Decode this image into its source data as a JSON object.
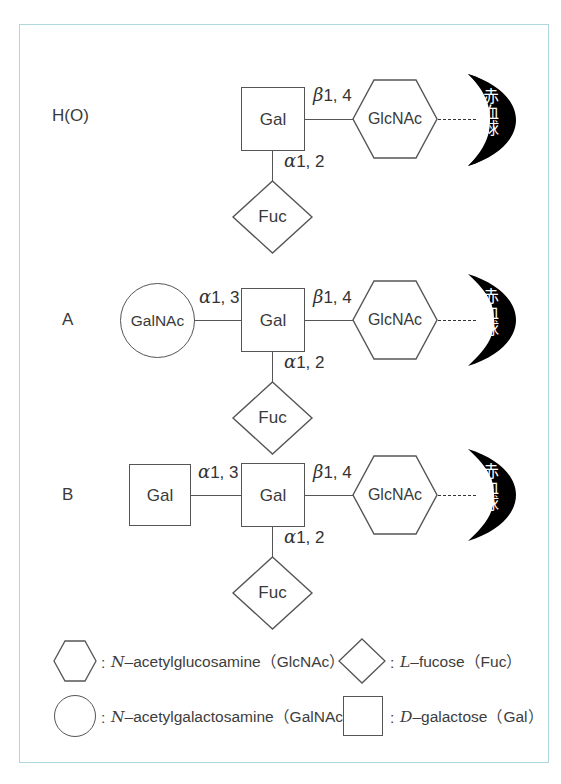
{
  "figure": {
    "title_visible": false,
    "border_color": "#aed8dd",
    "line_color": "#555555",
    "text_color": "#3a3a3a",
    "rbc_color": "#000000",
    "rbc_text_color": "#ffffff"
  },
  "rows": [
    {
      "id": "H(O)",
      "label": "H(O)",
      "nodes": [
        {
          "name": "Gal",
          "shape": "square"
        },
        {
          "name": "GlcNAc",
          "shape": "hexagon"
        },
        {
          "name": "Fuc",
          "shape": "diamond"
        }
      ],
      "bonds": [
        {
          "greek": "β",
          "numbers": "1, 4"
        },
        {
          "greek": "α",
          "numbers": "1, 2"
        }
      ],
      "cell": "赤血球"
    },
    {
      "id": "A",
      "label": "A",
      "nodes": [
        {
          "name": "GalNAc",
          "shape": "circle"
        },
        {
          "name": "Gal",
          "shape": "square"
        },
        {
          "name": "GlcNAc",
          "shape": "hexagon"
        },
        {
          "name": "Fuc",
          "shape": "diamond"
        }
      ],
      "bonds": [
        {
          "greek": "α",
          "numbers": "1, 3"
        },
        {
          "greek": "β",
          "numbers": "1, 4"
        },
        {
          "greek": "α",
          "numbers": "1, 2"
        }
      ],
      "cell": "赤血球"
    },
    {
      "id": "B",
      "label": "B",
      "nodes": [
        {
          "name": "Gal",
          "shape": "square"
        },
        {
          "name": "Gal",
          "shape": "square"
        },
        {
          "name": "GlcNAc",
          "shape": "hexagon"
        },
        {
          "name": "Fuc",
          "shape": "diamond"
        }
      ],
      "bonds": [
        {
          "greek": "α",
          "numbers": "1, 3"
        },
        {
          "greek": "β",
          "numbers": "1, 4"
        },
        {
          "greek": "α",
          "numbers": "1, 2"
        }
      ],
      "cell": "赤血球"
    }
  ],
  "labels": {
    "gal": "Gal",
    "galnac": "GalNAc",
    "glcnac": "GlcNAc",
    "fuc": "Fuc",
    "rbc": "赤血球",
    "row_ho": "H(O)",
    "row_a": "A",
    "row_b": "B",
    "beta": "β",
    "alpha": "α",
    "b14": "1, 4",
    "a13": "1, 3",
    "a12": "1, 2",
    "colon": ":"
  },
  "legend": {
    "items": [
      {
        "shape": "hexagon",
        "separator": ":",
        "italic_prefix": "N",
        "text": "–acetylglucosamine（GlcNAc）"
      },
      {
        "shape": "diamond",
        "separator": ":",
        "italic_prefix": "L",
        "text": "–fucose（Fuc）"
      },
      {
        "shape": "circle",
        "separator": ":",
        "italic_prefix": "N",
        "text": "–acetylgalactosamine（GalNAc）"
      },
      {
        "shape": "square",
        "separator": ":",
        "italic_prefix": "D",
        "text": "–galactose（Gal）"
      }
    ]
  }
}
